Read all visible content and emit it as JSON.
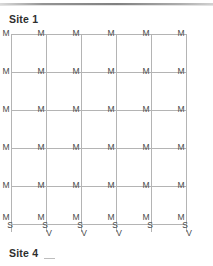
{
  "page": {
    "caption_top": "Site 1",
    "caption_bottom": "Site 4",
    "caption_bottom_mark": "_"
  },
  "chart_data": {
    "type": "diagram",
    "title": "Site 1",
    "subtitle": "Site 4",
    "grid": {
      "columns": 6,
      "rows": 6,
      "column_x": [
        11,
        46,
        81,
        116,
        151,
        186
      ],
      "row_y": [
        34,
        72,
        110,
        148,
        186,
        224
      ],
      "line_color": "#b4b4b4",
      "grid": true
    },
    "node_labels": {
      "interior_label": "M",
      "bottom_labels_full": [
        "M",
        "S",
        "V"
      ],
      "bottom_labels_short": [
        "M",
        "S"
      ]
    },
    "nodes": [
      {
        "col": 1,
        "row": 1,
        "labels": [
          "M"
        ]
      },
      {
        "col": 2,
        "row": 1,
        "labels": [
          "M"
        ]
      },
      {
        "col": 3,
        "row": 1,
        "labels": [
          "M"
        ]
      },
      {
        "col": 4,
        "row": 1,
        "labels": [
          "M"
        ]
      },
      {
        "col": 5,
        "row": 1,
        "labels": [
          "M"
        ]
      },
      {
        "col": 6,
        "row": 1,
        "labels": [
          "M"
        ]
      },
      {
        "col": 1,
        "row": 2,
        "labels": [
          "M"
        ]
      },
      {
        "col": 2,
        "row": 2,
        "labels": [
          "M"
        ]
      },
      {
        "col": 3,
        "row": 2,
        "labels": [
          "M"
        ]
      },
      {
        "col": 4,
        "row": 2,
        "labels": [
          "M"
        ]
      },
      {
        "col": 5,
        "row": 2,
        "labels": [
          "M"
        ]
      },
      {
        "col": 6,
        "row": 2,
        "labels": [
          "M"
        ]
      },
      {
        "col": 1,
        "row": 3,
        "labels": [
          "M"
        ]
      },
      {
        "col": 2,
        "row": 3,
        "labels": [
          "M"
        ]
      },
      {
        "col": 3,
        "row": 3,
        "labels": [
          "M"
        ]
      },
      {
        "col": 4,
        "row": 3,
        "labels": [
          "M"
        ]
      },
      {
        "col": 5,
        "row": 3,
        "labels": [
          "M"
        ]
      },
      {
        "col": 6,
        "row": 3,
        "labels": [
          "M"
        ]
      },
      {
        "col": 1,
        "row": 4,
        "labels": [
          "M"
        ]
      },
      {
        "col": 2,
        "row": 4,
        "labels": [
          "M"
        ]
      },
      {
        "col": 3,
        "row": 4,
        "labels": [
          "M"
        ]
      },
      {
        "col": 4,
        "row": 4,
        "labels": [
          "M"
        ]
      },
      {
        "col": 5,
        "row": 4,
        "labels": [
          "M"
        ]
      },
      {
        "col": 6,
        "row": 4,
        "labels": [
          "M"
        ]
      },
      {
        "col": 1,
        "row": 5,
        "labels": [
          "M"
        ]
      },
      {
        "col": 2,
        "row": 5,
        "labels": [
          "M"
        ]
      },
      {
        "col": 3,
        "row": 5,
        "labels": [
          "M"
        ]
      },
      {
        "col": 4,
        "row": 5,
        "labels": [
          "M"
        ]
      },
      {
        "col": 5,
        "row": 5,
        "labels": [
          "M"
        ]
      },
      {
        "col": 6,
        "row": 5,
        "labels": [
          "M"
        ]
      },
      {
        "col": 1,
        "row": 6,
        "labels": [
          "M",
          "S"
        ]
      },
      {
        "col": 2,
        "row": 6,
        "labels": [
          "M",
          "S",
          "V"
        ]
      },
      {
        "col": 3,
        "row": 6,
        "labels": [
          "M",
          "S",
          "V"
        ]
      },
      {
        "col": 4,
        "row": 6,
        "labels": [
          "M",
          "S",
          "V"
        ]
      },
      {
        "col": 5,
        "row": 6,
        "labels": [
          "M",
          "S"
        ]
      },
      {
        "col": 6,
        "row": 6,
        "labels": [
          "M",
          "S",
          "V"
        ]
      }
    ]
  }
}
